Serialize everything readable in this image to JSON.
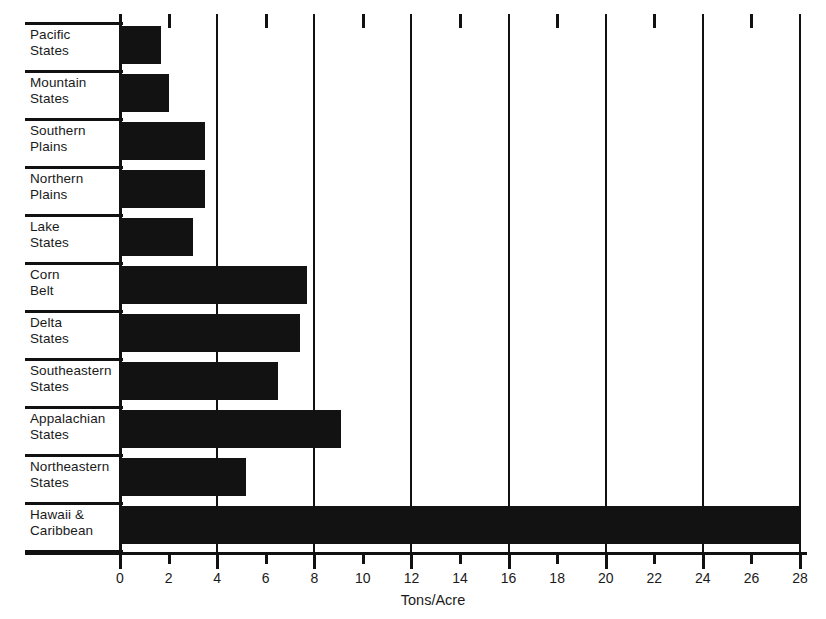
{
  "chart_data": {
    "type": "bar",
    "orientation": "horizontal",
    "title": "",
    "xlabel": "Tons/Acre",
    "ylabel": "",
    "xlim": [
      0,
      28
    ],
    "xticks": [
      0,
      2,
      4,
      6,
      8,
      10,
      12,
      14,
      16,
      18,
      20,
      22,
      24,
      26,
      28
    ],
    "xtick_labels": [
      "0",
      "2",
      "4",
      "6",
      "8",
      "10",
      "12",
      "14",
      "16",
      "18",
      "20",
      "22",
      "24",
      "26",
      "28"
    ],
    "gridlines_at": [
      0,
      4,
      8,
      12,
      16,
      20,
      24,
      28
    ],
    "grid": true,
    "legend": null,
    "bar_color": "#121212",
    "categories": [
      "Pacific States",
      "Mountain States",
      "Southern Plains",
      "Northern Plains",
      "Lake States",
      "Corn Belt",
      "Delta States",
      "Southeastern States",
      "Appalachian States",
      "Northeastern States",
      "Hawaii & Caribbean"
    ],
    "values": [
      1.7,
      2.0,
      3.5,
      3.5,
      3.0,
      7.7,
      7.4,
      6.5,
      9.1,
      5.2,
      28.0
    ],
    "bars": [
      {
        "label_line1": "Pacific",
        "label_line2": "States",
        "value": 1.7
      },
      {
        "label_line1": "Mountain",
        "label_line2": "States",
        "value": 2.0
      },
      {
        "label_line1": "Southern",
        "label_line2": "Plains",
        "value": 3.5
      },
      {
        "label_line1": "Northern",
        "label_line2": "Plains",
        "value": 3.5
      },
      {
        "label_line1": "Lake",
        "label_line2": "States",
        "value": 3.0
      },
      {
        "label_line1": "Corn",
        "label_line2": "Belt",
        "value": 7.7
      },
      {
        "label_line1": "Delta",
        "label_line2": "States",
        "value": 7.4
      },
      {
        "label_line1": "Southeastern",
        "label_line2": "States",
        "value": 6.5
      },
      {
        "label_line1": "Appalachian",
        "label_line2": "States",
        "value": 9.1
      },
      {
        "label_line1": "Northeastern",
        "label_line2": "States",
        "value": 5.2
      },
      {
        "label_line1": "Hawaii &",
        "label_line2": "Caribbean",
        "value": 28.0
      }
    ]
  }
}
